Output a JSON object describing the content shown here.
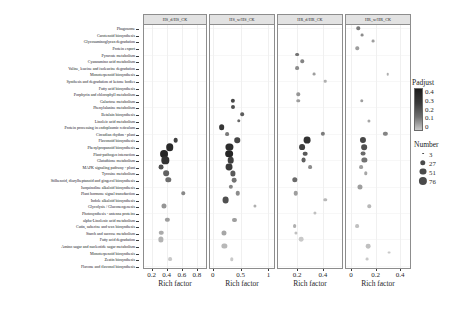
{
  "figure": {
    "type": "dot-plot",
    "x_axis_title": "Rich factor"
  },
  "pathways": [
    "Phagosome",
    "Carotenoid biosynthesis",
    "Glycosaminoglycan degradation",
    "Protein export",
    "Pyruvate metabolism",
    "Cyanoamino acid metabolism",
    "Valine, leucine and isoleucine degradation",
    "Monoterpenoid biosynthesis",
    "Synthesis and degradation of ketone bodies",
    "Fatty acid biosynthesis",
    "Porphyrin and chlorophyll metabolism",
    "Galactose metabolism",
    "Phenylalanine metabolism",
    "Betalain biosynthesis",
    "Linoleic acid metabolism",
    "Protein processing in endoplasmic reticulum",
    "Circadian rhythm - plant",
    "Flavonoid biosynthesis",
    "Phenylpropanoid biosynthesis",
    "Plant-pathogen interaction",
    "Glutathione metabolism",
    "MAPK signaling pathway - plant",
    "Tyrosine metabolism",
    "Stilbenoid, diarylheptanoid and gingerol biosynthesis",
    "Isoquinoline alkaloid biosynthesis",
    "Plant hormone signal transduction",
    "Indole alkaloid biosynthesis",
    "Glycolysis / Gluconeogenesis",
    "Photosynthesis - antenna proteins",
    "alpha-Linolenic acid metabolism",
    "Cutin, suberine and wax biosynthesis",
    "Starch and sucrose metabolism",
    "Fatty acid degradation",
    "Amino sugar and nucleotide sugar metabolism",
    "Monoterpenoid biosynthesis ",
    "Zeatin biosynthesis",
    "Flavone and flavonol biosynthesis"
  ],
  "panels": [
    {
      "title": "HS_d/HS_CK",
      "xticks": [
        "0.2",
        "0.4",
        "0.6",
        "0.8"
      ],
      "xtick_values": [
        0.2,
        0.4,
        0.6,
        0.8
      ],
      "xlim": [
        0.1,
        0.92
      ],
      "points": [
        {
          "pathway_index": 17,
          "rich_factor": 0.52,
          "number": 18,
          "padjust": 0.09
        },
        {
          "pathway_index": 18,
          "rich_factor": 0.44,
          "number": 62,
          "padjust": 0.03
        },
        {
          "pathway_index": 19,
          "rich_factor": 0.37,
          "number": 70,
          "padjust": 0.02
        },
        {
          "pathway_index": 20,
          "rich_factor": 0.38,
          "number": 58,
          "padjust": 0.05
        },
        {
          "pathway_index": 21,
          "rich_factor": 0.33,
          "number": 20,
          "padjust": 0.12
        },
        {
          "pathway_index": 22,
          "rich_factor": 0.39,
          "number": 30,
          "padjust": 0.16
        },
        {
          "pathway_index": 23,
          "rich_factor": 0.42,
          "number": 26,
          "padjust": 0.19
        },
        {
          "pathway_index": 25,
          "rich_factor": 0.62,
          "number": 8,
          "padjust": 0.25
        },
        {
          "pathway_index": 27,
          "rich_factor": 0.37,
          "number": 22,
          "padjust": 0.28
        },
        {
          "pathway_index": 29,
          "rich_factor": 0.41,
          "number": 14,
          "padjust": 0.3
        },
        {
          "pathway_index": 31,
          "rich_factor": 0.33,
          "number": 16,
          "padjust": 0.33
        },
        {
          "pathway_index": 32,
          "rich_factor": 0.32,
          "number": 24,
          "padjust": 0.35
        },
        {
          "pathway_index": 35,
          "rich_factor": 0.45,
          "number": 10,
          "padjust": 0.4
        }
      ]
    },
    {
      "title": "HS_w/HS_CK",
      "xticks": [
        "0",
        "0.5",
        "1"
      ],
      "xtick_values": [
        0,
        0.5,
        1
      ],
      "xlim": [
        -0.05,
        1.1
      ],
      "points": [
        {
          "pathway_index": 11,
          "rich_factor": 0.36,
          "number": 14,
          "padjust": 0.1
        },
        {
          "pathway_index": 12,
          "rich_factor": 0.37,
          "number": 12,
          "padjust": 0.12
        },
        {
          "pathway_index": 13,
          "rich_factor": 0.53,
          "number": 9,
          "padjust": 0.15
        },
        {
          "pathway_index": 14,
          "rich_factor": 0.47,
          "number": 8,
          "padjust": 0.18
        },
        {
          "pathway_index": 15,
          "rich_factor": 0.16,
          "number": 30,
          "padjust": 0.06
        },
        {
          "pathway_index": 16,
          "rich_factor": 0.26,
          "number": 10,
          "padjust": 0.22
        },
        {
          "pathway_index": 17,
          "rich_factor": 0.44,
          "number": 28,
          "padjust": 0.1
        },
        {
          "pathway_index": 18,
          "rich_factor": 0.3,
          "number": 54,
          "padjust": 0.04
        },
        {
          "pathway_index": 19,
          "rich_factor": 0.3,
          "number": 66,
          "padjust": 0.02
        },
        {
          "pathway_index": 20,
          "rich_factor": 0.32,
          "number": 44,
          "padjust": 0.08
        },
        {
          "pathway_index": 21,
          "rich_factor": 0.29,
          "number": 50,
          "padjust": 0.07
        },
        {
          "pathway_index": 22,
          "rich_factor": 0.36,
          "number": 24,
          "padjust": 0.14
        },
        {
          "pathway_index": 23,
          "rich_factor": 0.39,
          "number": 18,
          "padjust": 0.2
        },
        {
          "pathway_index": 24,
          "rich_factor": 0.32,
          "number": 14,
          "padjust": 0.24
        },
        {
          "pathway_index": 25,
          "rich_factor": 0.45,
          "number": 16,
          "padjust": 0.26
        },
        {
          "pathway_index": 26,
          "rich_factor": 0.23,
          "number": 48,
          "padjust": 0.12
        },
        {
          "pathway_index": 27,
          "rich_factor": 0.75,
          "number": 6,
          "padjust": 0.34
        },
        {
          "pathway_index": 29,
          "rich_factor": 0.39,
          "number": 12,
          "padjust": 0.3
        },
        {
          "pathway_index": 31,
          "rich_factor": 0.2,
          "number": 22,
          "padjust": 0.32
        },
        {
          "pathway_index": 33,
          "rich_factor": 0.21,
          "number": 24,
          "padjust": 0.36
        },
        {
          "pathway_index": 35,
          "rich_factor": 0.34,
          "number": 8,
          "padjust": 0.4
        }
      ]
    },
    {
      "title": "HR_d/HR_CK",
      "xticks": [
        "0.2",
        "0.4"
      ],
      "xtick_values": [
        0.2,
        0.4
      ],
      "xlim": [
        0.05,
        0.55
      ],
      "points": [
        {
          "pathway_index": 4,
          "rich_factor": 0.2,
          "number": 10,
          "padjust": 0.2
        },
        {
          "pathway_index": 5,
          "rich_factor": 0.24,
          "number": 8,
          "padjust": 0.24
        },
        {
          "pathway_index": 6,
          "rich_factor": 0.2,
          "number": 10,
          "padjust": 0.26
        },
        {
          "pathway_index": 7,
          "rich_factor": 0.33,
          "number": 5,
          "padjust": 0.3
        },
        {
          "pathway_index": 8,
          "rich_factor": 0.42,
          "number": 4,
          "padjust": 0.34
        },
        {
          "pathway_index": 10,
          "rich_factor": 0.21,
          "number": 8,
          "padjust": 0.28
        },
        {
          "pathway_index": 11,
          "rich_factor": 0.21,
          "number": 8,
          "padjust": 0.3
        },
        {
          "pathway_index": 16,
          "rich_factor": 0.4,
          "number": 14,
          "padjust": 0.22
        },
        {
          "pathway_index": 17,
          "rich_factor": 0.28,
          "number": 48,
          "padjust": 0.05
        },
        {
          "pathway_index": 18,
          "rich_factor": 0.24,
          "number": 32,
          "padjust": 0.08
        },
        {
          "pathway_index": 19,
          "rich_factor": 0.26,
          "number": 18,
          "padjust": 0.14
        },
        {
          "pathway_index": 20,
          "rich_factor": 0.25,
          "number": 20,
          "padjust": 0.16
        },
        {
          "pathway_index": 21,
          "rich_factor": 0.3,
          "number": 10,
          "padjust": 0.26
        },
        {
          "pathway_index": 23,
          "rich_factor": 0.18,
          "number": 26,
          "padjust": 0.18
        },
        {
          "pathway_index": 25,
          "rich_factor": 0.19,
          "number": 16,
          "padjust": 0.3
        },
        {
          "pathway_index": 26,
          "rich_factor": 0.42,
          "number": 8,
          "padjust": 0.36
        },
        {
          "pathway_index": 28,
          "rich_factor": 0.34,
          "number": 6,
          "padjust": 0.38
        },
        {
          "pathway_index": 30,
          "rich_factor": 0.18,
          "number": 10,
          "padjust": 0.34
        },
        {
          "pathway_index": 31,
          "rich_factor": 0.19,
          "number": 6,
          "padjust": 0.38
        },
        {
          "pathway_index": 32,
          "rich_factor": 0.23,
          "number": 18,
          "padjust": 0.4
        }
      ]
    },
    {
      "title": "HR_w/HR_CK",
      "xticks": [
        "0",
        "0.2",
        "0.4"
      ],
      "xtick_values": [
        0,
        0.2,
        0.4
      ],
      "xlim": [
        -0.04,
        0.48
      ],
      "points": [
        {
          "pathway_index": 0,
          "rich_factor": 0.06,
          "number": 8,
          "padjust": 0.22
        },
        {
          "pathway_index": 1,
          "rich_factor": 0.09,
          "number": 5,
          "padjust": 0.26
        },
        {
          "pathway_index": 2,
          "rich_factor": 0.18,
          "number": 5,
          "padjust": 0.3
        },
        {
          "pathway_index": 3,
          "rich_factor": 0.05,
          "number": 8,
          "padjust": 0.3
        },
        {
          "pathway_index": 7,
          "rich_factor": 0.3,
          "number": 4,
          "padjust": 0.34
        },
        {
          "pathway_index": 11,
          "rich_factor": 0.09,
          "number": 8,
          "padjust": 0.3
        },
        {
          "pathway_index": 14,
          "rich_factor": 0.15,
          "number": 6,
          "padjust": 0.32
        },
        {
          "pathway_index": 16,
          "rich_factor": 0.28,
          "number": 14,
          "padjust": 0.24
        },
        {
          "pathway_index": 17,
          "rich_factor": 0.1,
          "number": 36,
          "padjust": 0.1
        },
        {
          "pathway_index": 18,
          "rich_factor": 0.11,
          "number": 30,
          "padjust": 0.12
        },
        {
          "pathway_index": 19,
          "rich_factor": 0.1,
          "number": 20,
          "padjust": 0.18
        },
        {
          "pathway_index": 20,
          "rich_factor": 0.11,
          "number": 24,
          "padjust": 0.2
        },
        {
          "pathway_index": 21,
          "rich_factor": 0.08,
          "number": 10,
          "padjust": 0.3
        },
        {
          "pathway_index": 22,
          "rich_factor": 0.12,
          "number": 8,
          "padjust": 0.32
        },
        {
          "pathway_index": 24,
          "rich_factor": 0.07,
          "number": 22,
          "padjust": 0.3
        },
        {
          "pathway_index": 27,
          "rich_factor": 0.15,
          "number": 8,
          "padjust": 0.36
        },
        {
          "pathway_index": 30,
          "rich_factor": 0.05,
          "number": 10,
          "padjust": 0.38
        },
        {
          "pathway_index": 33,
          "rich_factor": 0.14,
          "number": 18,
          "padjust": 0.38
        },
        {
          "pathway_index": 34,
          "rich_factor": 0.31,
          "number": 5,
          "padjust": 0.4
        },
        {
          "pathway_index": 35,
          "rich_factor": 0.13,
          "number": 5,
          "padjust": 0.4
        }
      ]
    }
  ],
  "legends": {
    "padjust": {
      "title": "Padjust",
      "ticks": [
        "0.4",
        "0.3",
        "0.2",
        "0.1",
        "0"
      ],
      "tick_values": [
        0.4,
        0.3,
        0.2,
        0.1,
        0
      ],
      "high_color": "#c9c9c9",
      "low_color": "#1c1c1c"
    },
    "number": {
      "title": "Number",
      "ticks": [
        "3",
        "27",
        "51",
        "76"
      ],
      "tick_values": [
        3,
        27,
        51,
        76
      ]
    }
  },
  "chart_data": {
    "type": "scatter",
    "title": "",
    "xlabel": "Rich factor",
    "ylabel": "",
    "grid": true,
    "legend_position": "right",
    "facets": [
      "HS_d/HS_CK",
      "HS_w/HS_CK",
      "HR_d/HR_CK",
      "HR_w/HR_CK"
    ],
    "size_encoding": "Number",
    "color_encoding": "Padjust",
    "color_range": [
      0,
      0.4
    ],
    "size_range": [
      3,
      76
    ],
    "categories": [
      "Phagosome",
      "Carotenoid biosynthesis",
      "Glycosaminoglycan degradation",
      "Protein export",
      "Pyruvate metabolism",
      "Cyanoamino acid metabolism",
      "Valine, leucine and isoleucine degradation",
      "Monoterpenoid biosynthesis",
      "Synthesis and degradation of ketone bodies",
      "Fatty acid biosynthesis",
      "Porphyrin and chlorophyll metabolism",
      "Galactose metabolism",
      "Phenylalanine metabolism",
      "Betalain biosynthesis",
      "Linoleic acid metabolism",
      "Protein processing in endoplasmic reticulum",
      "Circadian rhythm - plant",
      "Flavonoid biosynthesis",
      "Phenylpropanoid biosynthesis",
      "Plant-pathogen interaction",
      "Glutathione metabolism",
      "MAPK signaling pathway - plant",
      "Tyrosine metabolism",
      "Stilbenoid, diarylheptanoid and gingerol biosynthesis",
      "Isoquinoline alkaloid biosynthesis",
      "Plant hormone signal transduction",
      "Indole alkaloid biosynthesis",
      "Glycolysis / Gluconeogenesis",
      "Photosynthesis - antenna proteins",
      "alpha-Linolenic acid metabolism",
      "Cutin, suberine and wax biosynthesis",
      "Starch and sucrose metabolism",
      "Fatty acid degradation",
      "Amino sugar and nucleotide sugar metabolism",
      "Monoterpenoid biosynthesis ",
      "Zeatin biosynthesis",
      "Flavone and flavonol biosynthesis"
    ]
  }
}
